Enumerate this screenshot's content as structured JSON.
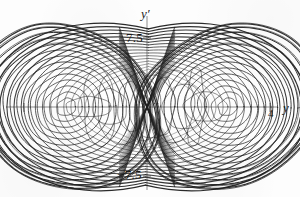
{
  "figure": {
    "title": "",
    "background_color": "#fdfdfd",
    "ink_color": "#1f1f1f",
    "axis_color": "#8a8a8a"
  },
  "axes": {
    "vertical": {
      "label": "y′",
      "label_name": "y-prime-axis-label",
      "ticks": [
        {
          "value": 7.5,
          "label": "7.5"
        },
        {
          "value": -7.5,
          "label": "−7.5"
        }
      ]
    },
    "horizontal": {
      "label": "y",
      "label_name": "y-axis-label",
      "ticks": [
        {
          "value": 4,
          "label": "4"
        },
        {
          "value": -4,
          "label": ""
        }
      ]
    }
  },
  "chart_data": {
    "type": "line",
    "title": "",
    "subtitle": "",
    "xlabel": "y",
    "ylabel": "y'",
    "xlim": [
      -5.6,
      5.6
    ],
    "ylim": [
      -11.5,
      11.5
    ],
    "grid": false,
    "legend": null,
    "annotations": [],
    "xticks": [
      -4,
      4
    ],
    "xticklabels": [
      "",
      "4"
    ],
    "yticks": [
      -7.5,
      7.5
    ],
    "yticklabels": [
      "−7.5",
      "7.5"
    ],
    "foci": [
      -2.6,
      2.6
    ],
    "series": [
      {
        "name": "trajectory",
        "kind": "phase-orbit-family",
        "color": "#1f1f1f",
        "linewidth": 0.75,
        "lobes": [
          {
            "name": "left-lobe",
            "center_x": -2.62,
            "center_y": 0.0,
            "orbits": [
              {
                "rx": 0.3,
                "ry": 0.95,
                "tilt": 0,
                "weight": 0.7
              },
              {
                "rx": 0.52,
                "ry": 1.6,
                "tilt": 0,
                "weight": 0.7
              },
              {
                "rx": 0.74,
                "ry": 2.25,
                "tilt": 1,
                "weight": 0.75
              },
              {
                "rx": 0.96,
                "ry": 2.9,
                "tilt": 1,
                "weight": 0.75
              },
              {
                "rx": 1.18,
                "ry": 3.55,
                "tilt": 2,
                "weight": 0.8
              },
              {
                "rx": 1.4,
                "ry": 4.2,
                "tilt": 2,
                "weight": 0.8
              },
              {
                "rx": 1.62,
                "ry": 4.85,
                "tilt": 3,
                "weight": 0.85
              },
              {
                "rx": 1.84,
                "ry": 5.5,
                "tilt": 3,
                "weight": 0.85
              },
              {
                "rx": 2.06,
                "ry": 6.15,
                "tilt": 4,
                "weight": 0.9
              },
              {
                "rx": 2.28,
                "ry": 6.8,
                "tilt": 4,
                "weight": 0.9
              },
              {
                "rx": 2.5,
                "ry": 7.4,
                "tilt": 5,
                "weight": 0.95
              },
              {
                "rx": 2.7,
                "ry": 8.0,
                "tilt": 5,
                "weight": 1.0
              },
              {
                "rx": 2.86,
                "ry": 8.55,
                "tilt": 6,
                "weight": 1.1
              },
              {
                "rx": 2.96,
                "ry": 8.95,
                "tilt": 6,
                "weight": 1.25
              }
            ]
          },
          {
            "name": "right-lobe",
            "center_x": 2.62,
            "center_y": 0.0,
            "orbits": [
              {
                "rx": 0.3,
                "ry": 0.95,
                "tilt": 0,
                "weight": 0.7
              },
              {
                "rx": 0.52,
                "ry": 1.6,
                "tilt": 0,
                "weight": 0.7
              },
              {
                "rx": 0.74,
                "ry": 2.25,
                "tilt": -1,
                "weight": 0.75
              },
              {
                "rx": 0.96,
                "ry": 2.9,
                "tilt": -1,
                "weight": 0.75
              },
              {
                "rx": 1.18,
                "ry": 3.55,
                "tilt": -2,
                "weight": 0.8
              },
              {
                "rx": 1.4,
                "ry": 4.2,
                "tilt": -2,
                "weight": 0.8
              },
              {
                "rx": 1.62,
                "ry": 4.85,
                "tilt": -3,
                "weight": 0.85
              },
              {
                "rx": 1.84,
                "ry": 5.5,
                "tilt": -3,
                "weight": 0.85
              },
              {
                "rx": 2.06,
                "ry": 6.15,
                "tilt": -4,
                "weight": 0.9
              },
              {
                "rx": 2.28,
                "ry": 6.8,
                "tilt": -4,
                "weight": 0.9
              },
              {
                "rx": 2.5,
                "ry": 7.4,
                "tilt": -5,
                "weight": 0.95
              },
              {
                "rx": 2.7,
                "ry": 8.0,
                "tilt": -5,
                "weight": 1.0
              },
              {
                "rx": 2.86,
                "ry": 8.55,
                "tilt": -6,
                "weight": 1.1
              },
              {
                "rx": 2.96,
                "ry": 8.95,
                "tilt": -6,
                "weight": 1.25
              }
            ]
          }
        ],
        "crossing_loops": {
          "name": "figure-eight-transitions",
          "crossing_y": 8.5,
          "count": 16,
          "outer_extent_x": 5.25,
          "outer_extent_y": 10.4
        },
        "inner_small_loops": {
          "name": "near-origin-small-orbits",
          "count": 12,
          "x_range": [
            -1.9,
            1.9
          ],
          "ry_range": [
            1.1,
            4.4
          ]
        }
      }
    ]
  }
}
